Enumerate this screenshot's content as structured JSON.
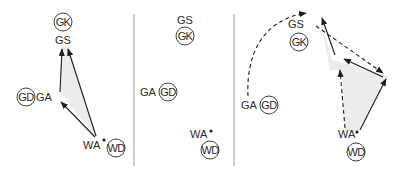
{
  "panels": [
    {
      "id": "left",
      "players": {
        "gk": {
          "role": "GK",
          "circled": true
        },
        "gs": {
          "role": "GS",
          "circled": false
        },
        "gd": {
          "role": "GD",
          "circled": true
        },
        "ga": {
          "role": "GA",
          "circled": false
        },
        "wa": {
          "role": "WA",
          "circled": false,
          "has_ball": true
        },
        "wd": {
          "role": "WD",
          "circled": true
        }
      },
      "passes": [
        {
          "from": "WA",
          "to": "GA",
          "style": "solid"
        },
        {
          "from": "GA",
          "to": "GS",
          "style": "solid"
        },
        {
          "from": "WA",
          "to": "GS",
          "style": "solid"
        }
      ],
      "shaded_region": true
    },
    {
      "id": "middle",
      "players": {
        "gs": {
          "role": "GS",
          "circled": false
        },
        "gk": {
          "role": "GK",
          "circled": true
        },
        "ga": {
          "role": "GA",
          "circled": false
        },
        "gd": {
          "role": "GD",
          "circled": true
        },
        "wa": {
          "role": "WA",
          "circled": false,
          "has_ball": true
        },
        "wd": {
          "role": "WD",
          "circled": true
        }
      },
      "passes": [],
      "shaded_region": false
    },
    {
      "id": "right",
      "players": {
        "gs": {
          "role": "GS",
          "circled": false
        },
        "gk": {
          "role": "GK",
          "circled": true
        },
        "ga": {
          "role": "GA",
          "circled": false
        },
        "gd": {
          "role": "GD",
          "circled": true
        },
        "wa": {
          "role": "WA",
          "circled": false,
          "has_ball": true
        },
        "wd": {
          "role": "WD",
          "circled": true
        }
      },
      "movements": [
        {
          "player": "GA",
          "style": "dashed",
          "description": "GA curved run toward top"
        },
        {
          "player": "GS",
          "style": "dashed",
          "description": "GS run diagonally down-right"
        },
        {
          "player": "WA",
          "style": "dashed",
          "description": "WA run upward"
        }
      ],
      "passes": [
        {
          "from": "WA",
          "to": "GS-new",
          "style": "solid"
        },
        {
          "from": "GS-new",
          "to": "WA-new",
          "style": "solid"
        },
        {
          "from": "WA-new",
          "to": "top",
          "style": "solid"
        }
      ],
      "shaded_region": true
    }
  ]
}
